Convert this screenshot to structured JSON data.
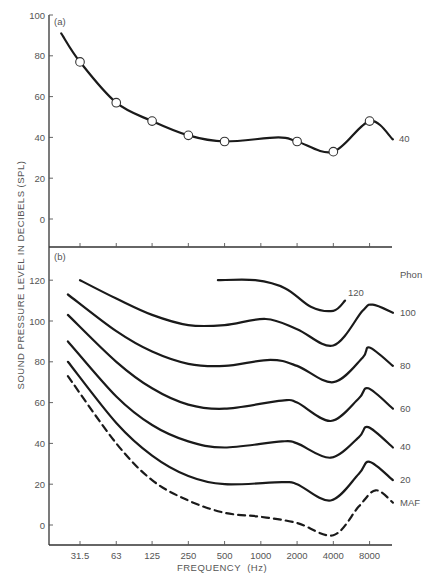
{
  "chart_data": [
    {
      "type": "line",
      "panel_label": "(a)",
      "title": "",
      "xlabel": "FREQUENCY (Hz)",
      "ylabel": "SOUND PRESSURE LEVEL IN DECIBELS (SPL)",
      "x_scale": "log2",
      "x_ticks": [
        "31.5",
        "63",
        "125",
        "250",
        "500",
        "1000",
        "2000",
        "4000",
        "8000"
      ],
      "y_ticks": [
        0,
        20,
        40,
        60,
        80,
        100
      ],
      "ylim": [
        -10,
        100
      ],
      "grid": false,
      "series": [
        {
          "name": "40",
          "style": "solid",
          "markers": "open-circle",
          "points": [
            {
              "f": 22,
              "db": 91
            },
            {
              "f": 31.5,
              "db": 77,
              "marker": true
            },
            {
              "f": 63,
              "db": 57,
              "marker": true
            },
            {
              "f": 125,
              "db": 48,
              "marker": true
            },
            {
              "f": 250,
              "db": 41,
              "marker": true
            },
            {
              "f": 500,
              "db": 38,
              "marker": true
            },
            {
              "f": 1400,
              "db": 40
            },
            {
              "f": 2000,
              "db": 38,
              "marker": true
            },
            {
              "f": 4000,
              "db": 33,
              "marker": true
            },
            {
              "f": 8000,
              "db": 48,
              "marker": true
            },
            {
              "f": 12500,
              "db": 39
            }
          ]
        }
      ]
    },
    {
      "type": "line",
      "panel_label": "(b)",
      "title": "",
      "xlabel": "FREQUENCY (Hz)",
      "ylabel": "SOUND PRESSURE LEVEL IN DECIBELS (SPL)",
      "x_scale": "log2",
      "x_ticks": [
        "31.5",
        "63",
        "125",
        "250",
        "500",
        "1000",
        "2000",
        "4000",
        "8000"
      ],
      "y_ticks": [
        0,
        20,
        40,
        60,
        80,
        100,
        120
      ],
      "ylim": [
        -10,
        130
      ],
      "grid": false,
      "legend_title": "Phon",
      "series": [
        {
          "name": "120",
          "style": "solid",
          "points": [
            {
              "f": 440,
              "db": 120
            },
            {
              "f": 900,
              "db": 120
            },
            {
              "f": 1600,
              "db": 116
            },
            {
              "f": 2600,
              "db": 107
            },
            {
              "f": 4000,
              "db": 105
            },
            {
              "f": 5000,
              "db": 110
            }
          ]
        },
        {
          "name": "100",
          "style": "solid",
          "points": [
            {
              "f": 31.5,
              "db": 120
            },
            {
              "f": 63,
              "db": 111
            },
            {
              "f": 125,
              "db": 103
            },
            {
              "f": 250,
              "db": 98
            },
            {
              "f": 500,
              "db": 98
            },
            {
              "f": 1100,
              "db": 101
            },
            {
              "f": 2000,
              "db": 96
            },
            {
              "f": 4000,
              "db": 88
            },
            {
              "f": 7000,
              "db": 105
            },
            {
              "f": 8500,
              "db": 108
            },
            {
              "f": 12500,
              "db": 104
            }
          ]
        },
        {
          "name": "80",
          "style": "solid",
          "points": [
            {
              "f": 25,
              "db": 113
            },
            {
              "f": 63,
              "db": 95
            },
            {
              "f": 125,
              "db": 85
            },
            {
              "f": 250,
              "db": 79
            },
            {
              "f": 500,
              "db": 78
            },
            {
              "f": 1200,
              "db": 81
            },
            {
              "f": 2000,
              "db": 78
            },
            {
              "f": 4000,
              "db": 70
            },
            {
              "f": 7000,
              "db": 82
            },
            {
              "f": 8000,
              "db": 87
            },
            {
              "f": 12500,
              "db": 78
            }
          ]
        },
        {
          "name": "60",
          "style": "solid",
          "points": [
            {
              "f": 25,
              "db": 103
            },
            {
              "f": 63,
              "db": 80
            },
            {
              "f": 125,
              "db": 67
            },
            {
              "f": 250,
              "db": 59
            },
            {
              "f": 500,
              "db": 57
            },
            {
              "f": 1500,
              "db": 61
            },
            {
              "f": 2000,
              "db": 60
            },
            {
              "f": 3800,
              "db": 51
            },
            {
              "f": 6500,
              "db": 62
            },
            {
              "f": 7800,
              "db": 67
            },
            {
              "f": 12500,
              "db": 57
            }
          ]
        },
        {
          "name": "40",
          "style": "solid",
          "points": [
            {
              "f": 25,
              "db": 90
            },
            {
              "f": 63,
              "db": 63
            },
            {
              "f": 125,
              "db": 49
            },
            {
              "f": 250,
              "db": 41
            },
            {
              "f": 500,
              "db": 38
            },
            {
              "f": 1500,
              "db": 41
            },
            {
              "f": 2000,
              "db": 40
            },
            {
              "f": 3800,
              "db": 33
            },
            {
              "f": 6500,
              "db": 43
            },
            {
              "f": 7800,
              "db": 48
            },
            {
              "f": 12500,
              "db": 38
            }
          ]
        },
        {
          "name": "20",
          "style": "solid",
          "points": [
            {
              "f": 25,
              "db": 80
            },
            {
              "f": 63,
              "db": 50
            },
            {
              "f": 125,
              "db": 34
            },
            {
              "f": 250,
              "db": 24
            },
            {
              "f": 500,
              "db": 20
            },
            {
              "f": 1500,
              "db": 21
            },
            {
              "f": 2000,
              "db": 20
            },
            {
              "f": 3800,
              "db": 12
            },
            {
              "f": 6500,
              "db": 25
            },
            {
              "f": 8000,
              "db": 31
            },
            {
              "f": 12500,
              "db": 22
            }
          ]
        },
        {
          "name": "MAF",
          "style": "dashed",
          "points": [
            {
              "f": 25,
              "db": 73
            },
            {
              "f": 63,
              "db": 40
            },
            {
              "f": 125,
              "db": 22
            },
            {
              "f": 250,
              "db": 12
            },
            {
              "f": 500,
              "db": 6
            },
            {
              "f": 1000,
              "db": 4
            },
            {
              "f": 2000,
              "db": 1
            },
            {
              "f": 4000,
              "db": -5
            },
            {
              "f": 6500,
              "db": 9
            },
            {
              "f": 9000,
              "db": 17
            },
            {
              "f": 12500,
              "db": 11
            }
          ]
        }
      ]
    }
  ],
  "figure": {
    "panel_a_label": "(a)",
    "panel_b_label": "(b)",
    "y_axis_title": "SOUND PRESSURE LEVEL IN DECIBELS (SPL)",
    "x_axis_title": "FREQUENCY  (Hz)",
    "legend_title": "Phon",
    "top_curve_label": "40",
    "x_tick_labels": [
      "31.5",
      "63",
      "125",
      "250",
      "500",
      "1000",
      "2000",
      "4000",
      "8000"
    ],
    "top_y_tick_labels": [
      "100",
      "80",
      "60",
      "40",
      "20",
      "0"
    ],
    "bottom_y_tick_labels": [
      "120",
      "100",
      "80",
      "60",
      "40",
      "20",
      "0"
    ],
    "curve_labels": [
      "120",
      "100",
      "80",
      "60",
      "40",
      "20",
      "MAF"
    ]
  }
}
